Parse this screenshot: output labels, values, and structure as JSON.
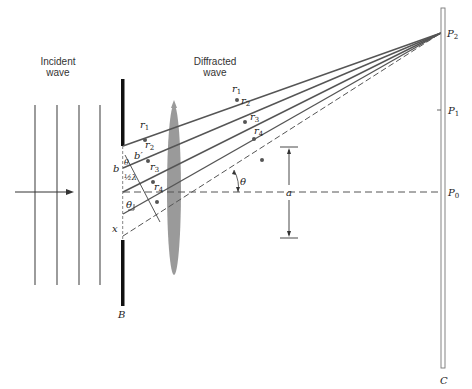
{
  "diagram": {
    "labels": {
      "incident_line1": "Incident",
      "incident_line2": "wave",
      "diffracted_line1": "Diffracted",
      "diffracted_line2": "wave",
      "r1": "r",
      "r1_sub": "1",
      "r2": "r",
      "r2_sub": "2",
      "r3": "r",
      "r3_sub": "3",
      "r4": "r",
      "r4_sub": "4",
      "b": "b",
      "b_prime": "b′",
      "theta_slit": "θ",
      "half_lambda": "½λ",
      "theta_lower": "θ",
      "x": "x",
      "theta_center": "θ",
      "a": "a",
      "barrier": "B",
      "screen": "C",
      "P0": "P",
      "P0_sub": "0",
      "P1": "P",
      "P1_sub": "1",
      "P2": "P",
      "P2_sub": "2"
    },
    "colors": {
      "ray": "#555555",
      "barrier": "#111111",
      "lens": "#9a9a9a",
      "screen": "#777777",
      "dash": "#555555"
    }
  }
}
